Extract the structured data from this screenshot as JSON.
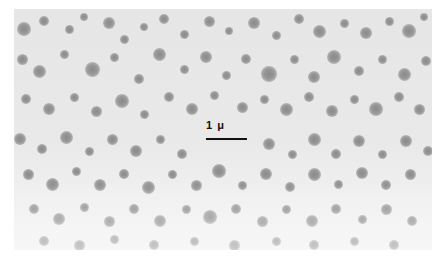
{
  "figure": {
    "type": "electron micrograph",
    "scale_bar": {
      "label": "1 μ",
      "length_px": 41
    },
    "colors": {
      "background": "#e8e8e8",
      "particle": "#8f8f8f",
      "scale_bar": "#111111"
    },
    "particles": [
      [
        10,
        20,
        14
      ],
      [
        30,
        12,
        10
      ],
      [
        55,
        20,
        9
      ],
      [
        70,
        8,
        8
      ],
      [
        95,
        14,
        12
      ],
      [
        110,
        30,
        9
      ],
      [
        130,
        18,
        8
      ],
      [
        150,
        10,
        10
      ],
      [
        170,
        25,
        9
      ],
      [
        195,
        12,
        11
      ],
      [
        215,
        22,
        8
      ],
      [
        240,
        14,
        12
      ],
      [
        262,
        26,
        9
      ],
      [
        285,
        10,
        10
      ],
      [
        305,
        22,
        13
      ],
      [
        330,
        14,
        9
      ],
      [
        352,
        24,
        12
      ],
      [
        375,
        12,
        9
      ],
      [
        395,
        22,
        14
      ],
      [
        410,
        8,
        8
      ],
      [
        8,
        50,
        11
      ],
      [
        25,
        62,
        13
      ],
      [
        50,
        45,
        9
      ],
      [
        78,
        60,
        15
      ],
      [
        100,
        48,
        9
      ],
      [
        125,
        70,
        10
      ],
      [
        145,
        45,
        13
      ],
      [
        170,
        60,
        9
      ],
      [
        192,
        48,
        12
      ],
      [
        212,
        66,
        9
      ],
      [
        232,
        50,
        10
      ],
      [
        255,
        65,
        16
      ],
      [
        280,
        50,
        9
      ],
      [
        300,
        68,
        12
      ],
      [
        320,
        48,
        14
      ],
      [
        345,
        62,
        10
      ],
      [
        368,
        50,
        9
      ],
      [
        390,
        65,
        13
      ],
      [
        412,
        52,
        10
      ],
      [
        12,
        90,
        10
      ],
      [
        35,
        100,
        12
      ],
      [
        60,
        88,
        9
      ],
      [
        82,
        102,
        11
      ],
      [
        108,
        92,
        14
      ],
      [
        130,
        105,
        9
      ],
      [
        155,
        88,
        10
      ],
      [
        178,
        100,
        12
      ],
      [
        200,
        86,
        9
      ],
      [
        228,
        98,
        11
      ],
      [
        250,
        90,
        9
      ],
      [
        272,
        100,
        13
      ],
      [
        295,
        88,
        10
      ],
      [
        318,
        102,
        12
      ],
      [
        340,
        90,
        9
      ],
      [
        362,
        100,
        14
      ],
      [
        385,
        88,
        10
      ],
      [
        405,
        100,
        11
      ],
      [
        6,
        130,
        12
      ],
      [
        28,
        140,
        10
      ],
      [
        52,
        128,
        13
      ],
      [
        75,
        142,
        9
      ],
      [
        98,
        130,
        11
      ],
      [
        122,
        142,
        12
      ],
      [
        146,
        130,
        9
      ],
      [
        168,
        145,
        10
      ],
      [
        255,
        135,
        12
      ],
      [
        278,
        145,
        9
      ],
      [
        300,
        130,
        13
      ],
      [
        322,
        145,
        10
      ],
      [
        345,
        132,
        12
      ],
      [
        368,
        145,
        9
      ],
      [
        392,
        132,
        12
      ],
      [
        414,
        142,
        10
      ],
      [
        14,
        165,
        11
      ],
      [
        38,
        175,
        13
      ],
      [
        62,
        162,
        9
      ],
      [
        86,
        176,
        12
      ],
      [
        110,
        165,
        10
      ],
      [
        134,
        178,
        13
      ],
      [
        158,
        165,
        9
      ],
      [
        182,
        176,
        11
      ],
      [
        205,
        162,
        14
      ],
      [
        228,
        176,
        9
      ],
      [
        252,
        165,
        12
      ],
      [
        276,
        178,
        10
      ],
      [
        300,
        165,
        13
      ],
      [
        324,
        175,
        9
      ],
      [
        348,
        164,
        12
      ],
      [
        372,
        176,
        10
      ],
      [
        396,
        165,
        11
      ],
      [
        20,
        200,
        10
      ],
      [
        45,
        210,
        12
      ],
      [
        70,
        198,
        9
      ],
      [
        95,
        212,
        11
      ],
      [
        120,
        200,
        10
      ],
      [
        146,
        212,
        12
      ],
      [
        172,
        200,
        9
      ],
      [
        196,
        208,
        14
      ],
      [
        222,
        200,
        10
      ],
      [
        248,
        212,
        11
      ],
      [
        272,
        200,
        9
      ],
      [
        298,
        212,
        12
      ],
      [
        322,
        200,
        10
      ],
      [
        348,
        210,
        9
      ],
      [
        372,
        200,
        11
      ],
      [
        398,
        212,
        10
      ],
      [
        30,
        232,
        10
      ],
      [
        65,
        236,
        11
      ],
      [
        100,
        230,
        9
      ],
      [
        140,
        236,
        10
      ],
      [
        180,
        232,
        9
      ],
      [
        220,
        236,
        11
      ],
      [
        262,
        232,
        9
      ],
      [
        300,
        236,
        10
      ],
      [
        340,
        232,
        9
      ],
      [
        380,
        236,
        10
      ]
    ]
  }
}
